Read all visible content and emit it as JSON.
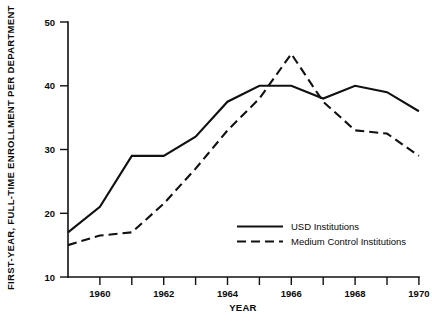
{
  "chart_data": {
    "type": "line",
    "title": "",
    "xlabel": "YEAR",
    "ylabel": "FIRST-YEAR, FULL-TIME ENROLLMENT PER DEPARTMENT",
    "xlim": [
      1959,
      1970
    ],
    "ylim": [
      10,
      50
    ],
    "xticks": [
      1959,
      1960,
      1961,
      1962,
      1963,
      1964,
      1965,
      1966,
      1967,
      1968,
      1969,
      1970
    ],
    "xtick_labels": [
      "",
      "1960",
      "",
      "1962",
      "",
      "1964",
      "",
      "1966",
      "",
      "1968",
      "",
      "1970"
    ],
    "yticks": [
      10,
      20,
      30,
      40,
      50
    ],
    "ytick_labels": [
      "10",
      "20",
      "30",
      "40",
      "50"
    ],
    "grid": false,
    "legend_position": "center-right",
    "x": [
      1959,
      1960,
      1961,
      1962,
      1963,
      1964,
      1965,
      1966,
      1967,
      1968,
      1969,
      1970
    ],
    "series": [
      {
        "name": "USD Institutions",
        "style": "solid",
        "values": [
          17,
          21,
          29,
          29,
          32,
          37.5,
          40,
          40,
          38,
          40,
          39,
          36
        ]
      },
      {
        "name": "Medium Control Institutions",
        "style": "dashed",
        "values": [
          15,
          16.5,
          17,
          21.5,
          27,
          33,
          38,
          45,
          37.5,
          33,
          32.5,
          29
        ]
      }
    ],
    "colors": {
      "axis": "#111111",
      "series_usd": "#111111",
      "series_medium": "#111111",
      "background": "#ffffff"
    }
  },
  "legend": {
    "entries": [
      {
        "label": "USD Institutions",
        "style": "solid"
      },
      {
        "label": "Medium Control Institutions",
        "style": "dashed"
      }
    ]
  },
  "axis": {
    "x_title": "YEAR",
    "y_title": "FIRST-YEAR, FULL-TIME ENROLLMENT PER DEPARTMENT"
  }
}
